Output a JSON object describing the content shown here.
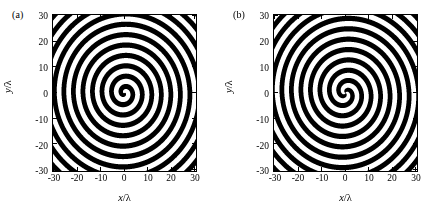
{
  "figure": {
    "background": "#ffffff",
    "ink": "#000000",
    "width": 443,
    "height": 221
  },
  "panels": [
    {
      "label": "(a)",
      "name": "panel-a",
      "xlabel_var": "x",
      "xlabel_slash": "/",
      "xlabel_unit": "λ",
      "ylabel_var": "y",
      "ylabel_slash": "/",
      "ylabel_unit": "λ",
      "xticks": [
        "-30",
        "-20",
        "-10",
        "0",
        "10",
        "20",
        "30"
      ],
      "yticks": [
        "30",
        "20",
        "10",
        "0",
        "-10",
        "-20",
        "-30"
      ]
    },
    {
      "label": "(b)",
      "name": "panel-b",
      "xlabel_var": "x",
      "xlabel_slash": "/",
      "xlabel_unit": "λ",
      "ylabel_var": "y",
      "ylabel_slash": "/",
      "ylabel_unit": "λ",
      "xticks": [
        "-30",
        "-20",
        "-10",
        "0",
        "10",
        "20",
        "30"
      ],
      "yticks": [
        "30",
        "20",
        "10",
        "0",
        "-10",
        "-20",
        "-30"
      ]
    }
  ],
  "chart_data": [
    {
      "type": "heatmap",
      "panel": "(a)",
      "title": "",
      "xlabel": "x/λ",
      "ylabel": "y/λ",
      "xlim": [
        -30,
        30
      ],
      "ylim": [
        -30,
        30
      ],
      "xticks": [
        -30,
        -20,
        -10,
        0,
        10,
        20,
        30
      ],
      "yticks": [
        -30,
        -20,
        -10,
        0,
        10,
        20,
        30
      ],
      "grid": false,
      "legend": false,
      "colormap": [
        "#ffffff",
        "#000000"
      ],
      "description": "Binary black/white spiral fringe pattern, single-armed Archimedean spiral (topological charge 1) centered at origin.",
      "field": {
        "formula": "binary_threshold(cos(k*r + l*theta))",
        "topological_charge": 1,
        "radial_period_lambda": 4.0,
        "phase_offset_rad": 0.9,
        "handedness": "counterclockwise",
        "threshold": 0.0,
        "fringe_count_along_positive_x": 8
      }
    },
    {
      "type": "heatmap",
      "panel": "(b)",
      "title": "",
      "xlabel": "x/λ",
      "ylabel": "y/λ",
      "xlim": [
        -30,
        30
      ],
      "ylim": [
        -30,
        30
      ],
      "xticks": [
        -30,
        -20,
        -10,
        0,
        10,
        20,
        30
      ],
      "yticks": [
        -30,
        -20,
        -10,
        0,
        10,
        20,
        30
      ],
      "grid": false,
      "legend": false,
      "colormap": [
        "#ffffff",
        "#000000"
      ],
      "description": "Binary black/white spiral fringe pattern, double-armed Archimedean spiral (topological charge 2) centered at origin.",
      "field": {
        "formula": "binary_threshold(cos(k*r + l*theta))",
        "topological_charge": 2,
        "radial_period_lambda": 4.0,
        "phase_offset_rad": 2.1,
        "handedness": "counterclockwise",
        "threshold": 0.0,
        "fringe_count_along_positive_x": 8
      }
    }
  ]
}
